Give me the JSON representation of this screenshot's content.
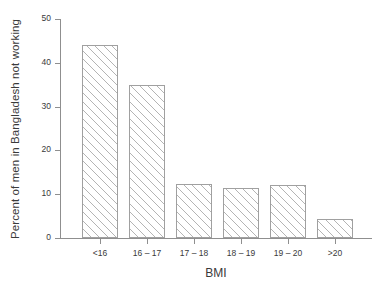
{
  "chart_data": {
    "type": "bar",
    "title": "",
    "subtitle": "",
    "xlabel": "BMI",
    "ylabel": "Percent of men in Bangladesh not working",
    "categories": [
      "<16",
      "16 – 17",
      "17 – 18",
      "18 – 19",
      "19 – 20",
      ">20"
    ],
    "values": [
      44,
      35,
      12.3,
      11.4,
      12,
      4.3
    ],
    "ylim": [
      0,
      50
    ],
    "yticks": [
      0,
      10,
      20,
      30,
      40,
      50
    ],
    "ytick_labels": [
      "0",
      "10",
      "20",
      "30",
      "40",
      "50"
    ],
    "grid": false,
    "legend": null,
    "annotations": [],
    "style": {
      "bar_fill": "#ffffff",
      "bar_hatch": "diagonal-45",
      "bar_hatch_color": "#b4b4b4",
      "bar_edge_color": "#a0a0a0",
      "axis_color": "#8f8f8f",
      "text_color": "#3a3a3a",
      "background": "#ffffff"
    }
  }
}
